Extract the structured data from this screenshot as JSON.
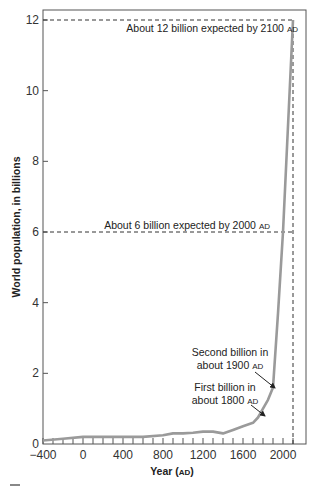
{
  "chart_data": {
    "type": "line",
    "title": "",
    "xlabel": "Year (AD)",
    "xlabel_parts": {
      "main": "Year (",
      "sc": "AD",
      "end": ")"
    },
    "ylabel": "World population, in billions",
    "xlim": [
      -400,
      2140
    ],
    "ylim": [
      0,
      12.3
    ],
    "x_ticks": [
      -400,
      0,
      400,
      800,
      1200,
      1600,
      2000
    ],
    "x_tick_labels": [
      "−400",
      "0",
      "400",
      "800",
      "1200",
      "1600",
      "2000"
    ],
    "x_minor_tick_step": 100,
    "y_ticks": [
      0,
      2,
      4,
      6,
      8,
      10,
      12
    ],
    "y_tick_labels": [
      "0",
      "2",
      "4",
      "6",
      "8",
      "10",
      "12"
    ],
    "grid": false,
    "legend": null,
    "series": [
      {
        "name": "World population",
        "color": "#9a9a9a",
        "x": [
          -400,
          -200,
          0,
          200,
          400,
          600,
          800,
          900,
          1000,
          1100,
          1200,
          1300,
          1400,
          1500,
          1600,
          1700,
          1750,
          1800,
          1850,
          1900,
          1950,
          2000,
          2050,
          2100
        ],
        "values": [
          0.1,
          0.15,
          0.2,
          0.2,
          0.2,
          0.2,
          0.25,
          0.3,
          0.3,
          0.32,
          0.35,
          0.35,
          0.3,
          0.4,
          0.5,
          0.6,
          0.75,
          1.0,
          1.25,
          1.6,
          3.7,
          6.0,
          9.0,
          12.0
        ]
      }
    ],
    "reference_lines": [
      {
        "y": 12,
        "x_end": 2100,
        "style": "dashed",
        "label": "About 12 billion expected by 2100",
        "label_sc": "AD"
      },
      {
        "y": 6,
        "x_end": 2100,
        "style": "dashed",
        "label": "About 6 billion expected by 2000",
        "label_sc": "AD"
      },
      {
        "x": 2100,
        "style": "dashed",
        "vertical": true
      }
    ],
    "annotations": [
      {
        "lines": [
          "Second billion in",
          "about 1900"
        ],
        "sc": "AD",
        "points_to": {
          "x": 1900,
          "y": 1.6
        }
      },
      {
        "lines": [
          "First billion in",
          "about 1800"
        ],
        "sc": "AD",
        "points_to": {
          "x": 1800,
          "y": 1.0
        }
      }
    ]
  },
  "labels": {
    "ann12": "About 12 billion expected by 2100 ",
    "ann6": "About 6 billion expected by 2000 ",
    "ad": "AD",
    "second_line1": "Second billion in",
    "second_line2": "about 1900 ",
    "first_line1": "First billion in",
    "first_line2": "about 1800 ",
    "ylabel": "World population, in billions",
    "xlabel_main": "Year (",
    "xlabel_end": ")"
  }
}
